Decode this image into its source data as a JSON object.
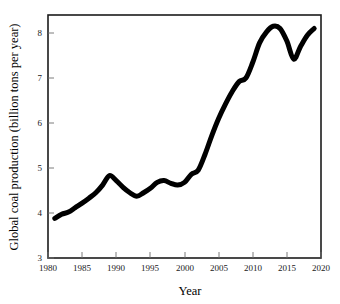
{
  "chart_data": {
    "type": "line",
    "title": "",
    "xlabel": "Year",
    "ylabel": "Global coal production (billion tons per year)",
    "xlim": [
      1980,
      2020
    ],
    "ylim": [
      3,
      8.4
    ],
    "xticks": [
      1980,
      1985,
      1990,
      1995,
      2000,
      2005,
      2010,
      2015,
      2020
    ],
    "yticks": [
      3,
      4,
      5,
      6,
      7,
      8
    ],
    "grid": false,
    "legend": "none",
    "line_color": "#000000",
    "line_width_px": 5,
    "x": [
      1981,
      1982,
      1983,
      1984,
      1985,
      1986,
      1987,
      1988,
      1989,
      1990,
      1991,
      1992,
      1993,
      1994,
      1995,
      1996,
      1997,
      1998,
      1999,
      2000,
      2001,
      2002,
      2003,
      2004,
      2005,
      2006,
      2007,
      2008,
      2009,
      2010,
      2011,
      2012,
      2013,
      2014,
      2015,
      2016,
      2017,
      2018,
      2019
    ],
    "series": [
      {
        "name": "Global coal production",
        "values": [
          3.88,
          3.97,
          4.02,
          4.12,
          4.22,
          4.33,
          4.45,
          4.62,
          4.83,
          4.72,
          4.57,
          4.45,
          4.37,
          4.45,
          4.55,
          4.68,
          4.72,
          4.66,
          4.62,
          4.68,
          4.86,
          4.95,
          5.3,
          5.72,
          6.1,
          6.42,
          6.7,
          6.92,
          7.0,
          7.35,
          7.78,
          8.02,
          8.15,
          8.1,
          7.82,
          7.42,
          7.7,
          7.95,
          8.1
        ]
      }
    ],
    "annotations": []
  },
  "axis": {
    "y_title": "Global coal production (billion tons per year)",
    "x_title": "Year",
    "y_tick_labels": [
      "8",
      "7",
      "6",
      "5",
      "4",
      "3"
    ],
    "x_tick_labels": [
      "1980",
      "1985",
      "1990",
      "1995",
      "2000",
      "2005",
      "2010",
      "2015",
      "2020"
    ]
  }
}
